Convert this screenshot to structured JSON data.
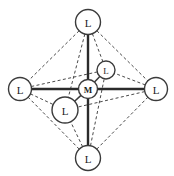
{
  "figure": {
    "background_color": "#ffffff",
    "bond_color": "#2b2b2b",
    "edge_color": "#4a4a4a",
    "node_fill": "#ffffff",
    "node_stroke": "#3b3b3b",
    "label_color": "#1c1c1c"
  },
  "nodes": [
    {
      "id": "top",
      "label": "L",
      "x": 88,
      "y": 22,
      "r": 12.5,
      "font_size": 11,
      "role": "ligand"
    },
    {
      "id": "bottom",
      "label": "L",
      "x": 88,
      "y": 158,
      "r": 12.5,
      "font_size": 11,
      "role": "ligand"
    },
    {
      "id": "left",
      "label": "L",
      "x": 20,
      "y": 89,
      "r": 11.5,
      "font_size": 11,
      "role": "ligand"
    },
    {
      "id": "right",
      "label": "L",
      "x": 156,
      "y": 89,
      "r": 11.5,
      "font_size": 11,
      "role": "ligand"
    },
    {
      "id": "back",
      "label": "L",
      "x": 106,
      "y": 70,
      "r": 9.0,
      "font_size": 9,
      "role": "ligand"
    },
    {
      "id": "front",
      "label": "L",
      "x": 65,
      "y": 110,
      "r": 13.0,
      "font_size": 11,
      "role": "ligand"
    },
    {
      "id": "metal",
      "label": "M",
      "x": 88,
      "y": 89,
      "r": 9.5,
      "font_size": 9,
      "role": "metal"
    }
  ],
  "bonds": [
    {
      "from": "metal",
      "to": "top",
      "style": "solid"
    },
    {
      "from": "metal",
      "to": "bottom",
      "style": "solid"
    },
    {
      "from": "metal",
      "to": "left",
      "style": "solid"
    },
    {
      "from": "metal",
      "to": "right",
      "style": "solid"
    },
    {
      "from": "metal",
      "to": "back",
      "style": "solid-thin"
    },
    {
      "from": "metal",
      "to": "front",
      "style": "solid-thin"
    }
  ],
  "edges": [
    {
      "from": "top",
      "to": "left",
      "style": "dashed"
    },
    {
      "from": "top",
      "to": "right",
      "style": "dashed"
    },
    {
      "from": "top",
      "to": "back",
      "style": "dashed"
    },
    {
      "from": "top",
      "to": "front",
      "style": "dashed"
    },
    {
      "from": "bottom",
      "to": "left",
      "style": "dashed"
    },
    {
      "from": "bottom",
      "to": "right",
      "style": "dashed"
    },
    {
      "from": "bottom",
      "to": "back",
      "style": "dashed"
    },
    {
      "from": "bottom",
      "to": "front",
      "style": "dashed"
    },
    {
      "from": "left",
      "to": "back",
      "style": "dashed"
    },
    {
      "from": "left",
      "to": "front",
      "style": "dashed"
    },
    {
      "from": "right",
      "to": "back",
      "style": "dashed"
    },
    {
      "from": "right",
      "to": "front",
      "style": "dashed"
    }
  ]
}
